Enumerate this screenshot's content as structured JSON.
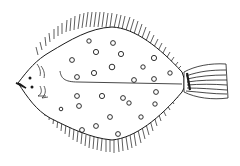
{
  "image": {
    "subject": "flatfish line drawing",
    "description": "Black ink sketch of a spotted flatfish (plaice) viewed from above, with fringed fins along the body and a striped tail on the right",
    "colors": {
      "background": "#ffffff",
      "ink": "#1a1a1a"
    }
  },
  "spots": [
    [
      89,
      41
    ],
    [
      113,
      43
    ],
    [
      96,
      52
    ],
    [
      121,
      54
    ],
    [
      72,
      60
    ],
    [
      154,
      58
    ],
    [
      112,
      67
    ],
    [
      94,
      73
    ],
    [
      143,
      67
    ],
    [
      170,
      73
    ],
    [
      77,
      77
    ],
    [
      134,
      80
    ],
    [
      154,
      79
    ],
    [
      156,
      92
    ],
    [
      77,
      96
    ],
    [
      102,
      96
    ],
    [
      123,
      98
    ],
    [
      129,
      103
    ],
    [
      155,
      104
    ],
    [
      79,
      106
    ],
    [
      61,
      109
    ],
    [
      110,
      117
    ],
    [
      141,
      117
    ],
    [
      96,
      126
    ],
    [
      82,
      130
    ],
    [
      118,
      134
    ]
  ]
}
